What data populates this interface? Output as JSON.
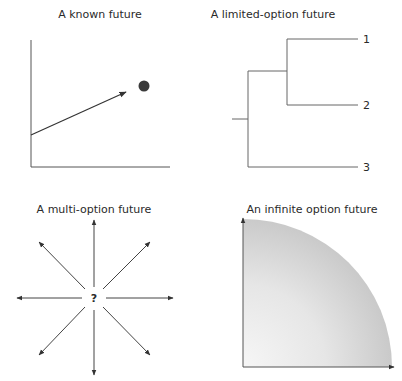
{
  "panels": [
    {
      "id": "known",
      "title": "A known future",
      "title_pos": [
        100,
        8
      ],
      "axes": {
        "origin": [
          31,
          167
        ],
        "y_top": 40,
        "x_right": 170
      },
      "arrow": {
        "from": [
          31,
          135
        ],
        "to": [
          126,
          92
        ]
      },
      "dot": {
        "cx": 144,
        "cy": 86,
        "r": 5.5,
        "color": "#3a3a3a"
      }
    },
    {
      "id": "limited",
      "title": "A limited-option future",
      "title_pos": [
        273,
        8
      ],
      "branches": [
        {
          "label": "1",
          "y": 39
        },
        {
          "label": "2",
          "y": 105
        },
        {
          "label": "3",
          "y": 167
        }
      ]
    },
    {
      "id": "multi",
      "title": "A multi-option future",
      "title_pos": [
        94,
        204
      ],
      "center": [
        94,
        298
      ],
      "center_label": "?",
      "directions": [
        "up",
        "up-right",
        "right",
        "down-right",
        "down",
        "down-left",
        "left",
        "up-left"
      ]
    },
    {
      "id": "infinite",
      "title": "An infinite option future",
      "title_pos": [
        312,
        204
      ],
      "axes": {
        "origin": [
          243,
          367
        ],
        "y_top": 218,
        "x_right": 393
      },
      "fill_colors": {
        "light": "#f6f6f6",
        "dark": "#c9c9c9"
      }
    }
  ],
  "colors": {
    "line": "#555555",
    "arrow": "#333333",
    "text": "#2a2a2a"
  }
}
